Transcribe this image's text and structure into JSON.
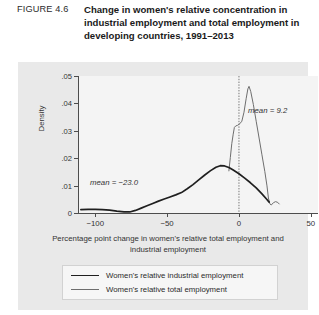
{
  "header": {
    "figure_label": "FIGURE 4.6",
    "title": "Change in women's relative concentration in industrial employment and total employment in developing countries, 1991–2013"
  },
  "chart_data": {
    "type": "line",
    "title": "Change in women's relative concentration in industrial employment and total employment in developing countries, 1991–2013",
    "xlabel": "Percentage point change in women's relative total employment and industrial employment",
    "ylabel": "Density",
    "xlim": [
      -112,
      55
    ],
    "ylim": [
      0,
      0.053
    ],
    "grid": false,
    "legend_position": "bottom",
    "xticks": [
      -100,
      -50,
      0,
      50
    ],
    "xtick_labels": [
      "−100",
      "−50",
      "0",
      "50"
    ],
    "yticks": [
      0,
      0.01,
      0.02,
      0.03,
      0.04,
      0.05
    ],
    "ytick_labels": [
      "0",
      ".01",
      ".02",
      ".03",
      ".04",
      ".05"
    ],
    "reference_line": {
      "x": 0,
      "style": "dotted"
    },
    "annotations": [
      {
        "text": "mean = −23.0",
        "series": "Women's relative industrial employment",
        "value": -23.0,
        "x": -62,
        "y": 0.0105
      },
      {
        "text": "mean = 9.2",
        "series": "Women's relative total employment",
        "value": 9.2,
        "x": 16,
        "y": 0.0385
      }
    ],
    "series": [
      {
        "name": "Women's relative industrial employment",
        "style": "thick-dark",
        "color": "#1f1f1f",
        "points": [
          [
            -110,
            0.0013
          ],
          [
            -105,
            0.0014
          ],
          [
            -100,
            0.0014
          ],
          [
            -95,
            0.0013
          ],
          [
            -90,
            0.0011
          ],
          [
            -85,
            0.0007
          ],
          [
            -80,
            0.0004
          ],
          [
            -76,
            0.0004
          ],
          [
            -72,
            0.001
          ],
          [
            -68,
            0.0019
          ],
          [
            -64,
            0.0028
          ],
          [
            -60,
            0.0037
          ],
          [
            -56,
            0.0046
          ],
          [
            -52,
            0.0054
          ],
          [
            -48,
            0.0062
          ],
          [
            -44,
            0.007
          ],
          [
            -40,
            0.0079
          ],
          [
            -36,
            0.0094
          ],
          [
            -32,
            0.011
          ],
          [
            -28,
            0.0128
          ],
          [
            -24,
            0.0146
          ],
          [
            -20,
            0.0163
          ],
          [
            -16,
            0.0177
          ],
          [
            -13,
            0.0183
          ],
          [
            -10,
            0.0182
          ],
          [
            -7,
            0.0176
          ],
          [
            -4,
            0.0166
          ],
          [
            0,
            0.0152
          ],
          [
            4,
            0.0135
          ],
          [
            8,
            0.0117
          ],
          [
            12,
            0.0097
          ],
          [
            16,
            0.0074
          ],
          [
            19,
            0.0055
          ],
          [
            21,
            0.0042
          ]
        ]
      },
      {
        "name": "Women's relative total employment",
        "style": "thin-gray",
        "color": "#6e6e6e",
        "points": [
          [
            -7,
            0.0163
          ],
          [
            -6,
            0.0215
          ],
          [
            -5,
            0.0268
          ],
          [
            -4,
            0.0305
          ],
          [
            -3.2,
            0.0331
          ],
          [
            -2.2,
            0.0337
          ],
          [
            -1,
            0.0339
          ],
          [
            0.5,
            0.0345
          ],
          [
            2,
            0.0355
          ],
          [
            3.5,
            0.039
          ],
          [
            5,
            0.0442
          ],
          [
            6.2,
            0.048
          ],
          [
            7,
            0.049
          ],
          [
            8.2,
            0.047
          ],
          [
            10,
            0.042
          ],
          [
            12,
            0.0355
          ],
          [
            14,
            0.029
          ],
          [
            16,
            0.0225
          ],
          [
            18,
            0.016
          ],
          [
            19.5,
            0.0105
          ],
          [
            20.5,
            0.0058
          ],
          [
            21.5,
            0.0035
          ],
          [
            22.5,
            0.0031
          ],
          [
            24,
            0.004
          ],
          [
            25.5,
            0.0044
          ],
          [
            27,
            0.0041
          ],
          [
            28,
            0.0035
          ]
        ]
      }
    ]
  },
  "legend": {
    "items": [
      {
        "label": "Women's relative industrial employment",
        "style": "thick"
      },
      {
        "label": "Women's relative total employment",
        "style": "thin"
      }
    ]
  }
}
